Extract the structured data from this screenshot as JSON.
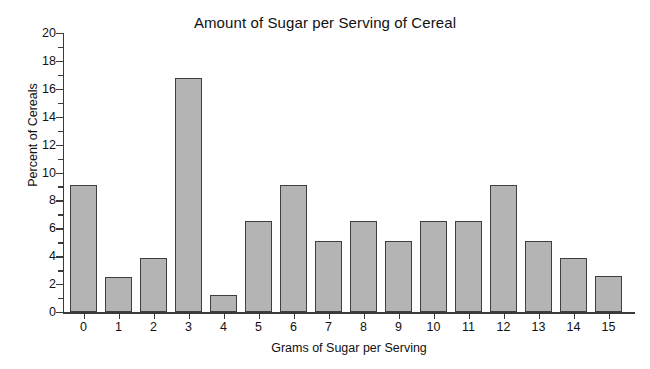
{
  "chart_data": {
    "type": "bar",
    "title": "Amount of Sugar per Serving of Cereal",
    "xlabel": "Grams of Sugar per Serving",
    "ylabel": "Percent of Cereals",
    "categories": [
      "0",
      "1",
      "2",
      "3",
      "4",
      "5",
      "6",
      "7",
      "8",
      "9",
      "10",
      "11",
      "12",
      "13",
      "14",
      "15"
    ],
    "values": [
      9.1,
      2.5,
      3.9,
      16.8,
      1.2,
      6.5,
      9.1,
      5.1,
      6.5,
      5.1,
      6.5,
      6.5,
      9.1,
      5.1,
      3.9,
      2.6
    ],
    "ylim": [
      0,
      20
    ],
    "y_major_ticks": [
      "0",
      "2",
      "4",
      "6",
      "8",
      "10",
      "12",
      "14",
      "16",
      "18",
      "20"
    ],
    "y_minor_ticks": [
      1,
      3,
      5,
      7,
      9,
      11,
      13,
      15,
      17,
      19
    ],
    "grid": false,
    "legend": null,
    "bar_fill_color": "#b4b4b4",
    "bar_edge_color": "#3f3f3f",
    "axis_color": "#3a3a3a",
    "background_color": "#ffffff"
  }
}
